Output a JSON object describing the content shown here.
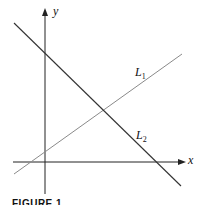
{
  "figure": {
    "caption": "FIGURE 1",
    "axes": {
      "x_label": "x",
      "y_label": "y"
    },
    "lines": [
      {
        "id": "L1",
        "name": "L",
        "subscript": "1",
        "description": "positive slope line",
        "color": "#8a8a8a"
      },
      {
        "id": "L2",
        "name": "L",
        "subscript": "2",
        "description": "negative slope line",
        "color": "#333333"
      }
    ]
  }
}
